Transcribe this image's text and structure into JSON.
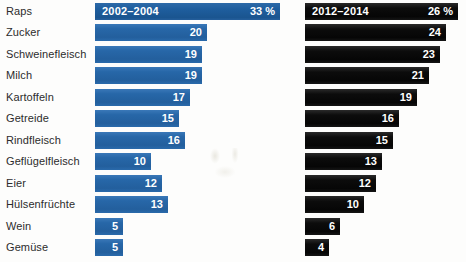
{
  "chart_data": {
    "type": "bar",
    "title": "",
    "subtitle": "",
    "xlabel": "",
    "ylabel": "",
    "grid": false,
    "legend_position": "top-inline",
    "value_unit": "%",
    "xlim": [
      0,
      33
    ],
    "categories": [
      "Raps",
      "Zucker",
      "Schweinefleisch",
      "Milch",
      "Kartoffeln",
      "Getreide",
      "Rindfleisch",
      "Geflügelfleisch",
      "Eier",
      "Hülsenfrüchte",
      "Wein",
      "Gemüse"
    ],
    "series": [
      {
        "name": "2002–2004",
        "color": "#2767a8",
        "header_label": "2002–2004",
        "header_value": "33 %",
        "values": [
          33,
          20,
          19,
          19,
          17,
          15,
          16,
          10,
          12,
          13,
          5,
          5
        ],
        "value_labels": [
          "33 %",
          "20",
          "19",
          "19",
          "17",
          "15",
          "16",
          "10",
          "12",
          "13",
          "5",
          "5"
        ]
      },
      {
        "name": "2012–2014",
        "color": "#0d0d0d",
        "header_label": "2012–2014",
        "header_value": "26 %",
        "values": [
          26,
          24,
          23,
          21,
          19,
          16,
          15,
          13,
          12,
          10,
          6,
          4
        ],
        "value_labels": [
          "26 %",
          "24",
          "23",
          "21",
          "19",
          "16",
          "15",
          "13",
          "12",
          "10",
          "6",
          "4"
        ]
      }
    ]
  },
  "colors": {
    "series_blue": "#2767a8",
    "series_blue_header": "#1f5f9f",
    "series_black": "#0d0d0d",
    "background": "#fdfdfc",
    "label_text": "#2c2c2c",
    "value_text": "#ffffff"
  }
}
